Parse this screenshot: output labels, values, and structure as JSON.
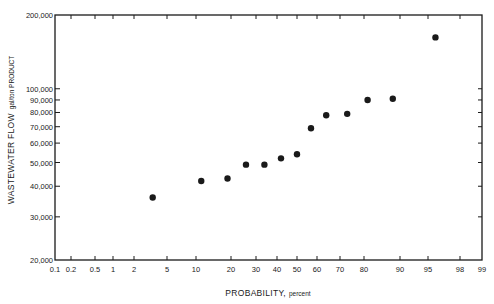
{
  "chart_data": {
    "type": "scatter",
    "title": "",
    "xlabel": "PROBABILITY",
    "xlabel_unit": "percent",
    "ylabel": "WASTEWATER FLOW",
    "ylabel_unit": "gal/ton PRODUCT",
    "x_scale": "probability",
    "y_scale": "log",
    "xlim": [
      0.1,
      99
    ],
    "ylim": [
      20000,
      200000
    ],
    "grid": false,
    "legend": null,
    "x_ticks": [
      0.1,
      0.2,
      0.5,
      1,
      2,
      5,
      10,
      20,
      30,
      40,
      50,
      60,
      70,
      80,
      90,
      95,
      98,
      99
    ],
    "x_tick_labels": [
      "0.1",
      "0.2",
      "0.5",
      "1",
      "2",
      "5",
      "10",
      "20",
      "30",
      "40",
      "50",
      "60",
      "70",
      "80",
      "90",
      "95",
      "98",
      "99"
    ],
    "y_ticks": [
      20000,
      30000,
      40000,
      50000,
      60000,
      70000,
      80000,
      90000,
      100000,
      200000
    ],
    "y_tick_labels": [
      "20,000",
      "30,000",
      "40,000",
      "50,000",
      "60,000",
      "70,000",
      "80,000",
      "90,000",
      "100,000",
      "200,000"
    ],
    "series": [
      {
        "name": "Wastewater flow",
        "marker": "circle",
        "color": "#1a1a1a",
        "x": [
          3.7,
          11.5,
          19,
          26,
          34,
          42,
          50,
          57,
          64,
          73,
          81,
          88,
          95.7
        ],
        "y": [
          36000,
          42000,
          43000,
          49000,
          49000,
          52000,
          54000,
          69000,
          78000,
          79000,
          90000,
          91000,
          162000
        ]
      }
    ]
  },
  "labels": {
    "xlabel": "PROBABILITY,",
    "xlabel_unit": "percent",
    "ylabel": "WASTEWATER FLOW",
    "ylabel_unit": "gal/ton PRODUCT"
  }
}
